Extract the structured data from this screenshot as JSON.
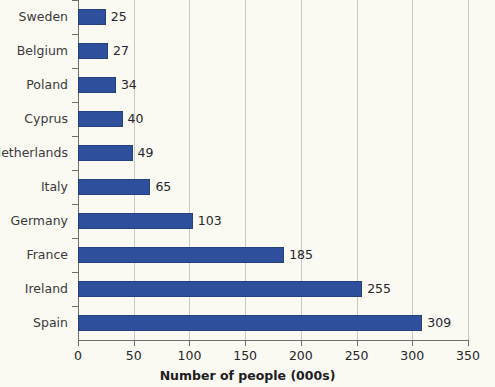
{
  "chart_data": {
    "type": "bar",
    "orientation": "horizontal",
    "title": "",
    "xlabel": "Number of people (000s)",
    "ylabel": "",
    "categories": [
      "Sweden",
      "Belgium",
      "Poland",
      "Cyprus",
      "Netherlands",
      "Italy",
      "Germany",
      "France",
      "Ireland",
      "Spain"
    ],
    "values": [
      25,
      27,
      34,
      40,
      49,
      65,
      103,
      185,
      255,
      309
    ],
    "data_labels": [
      "25",
      "27",
      "34",
      "40",
      "49",
      "65",
      "103",
      "185",
      "255",
      "309"
    ],
    "xlim": [
      0,
      350
    ],
    "xticks": [
      0,
      50,
      100,
      150,
      200,
      250,
      300,
      350
    ],
    "xtick_labels": [
      "0",
      "50",
      "100",
      "150",
      "200",
      "250",
      "300",
      "350"
    ],
    "grid": true,
    "grid_axis": "x",
    "legend": false,
    "bar_color": "#2e4f9b",
    "bar_edge_color": "#24407f",
    "background_color": "#faf9f2",
    "gridline_color": "#c9c8c2",
    "axis_color": "#6d6d6d",
    "label_color": "#3a3a3c"
  }
}
